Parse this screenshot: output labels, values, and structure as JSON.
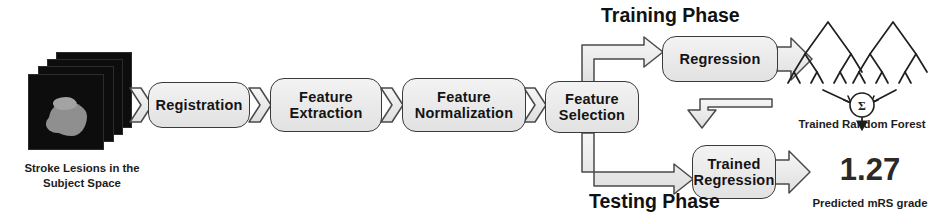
{
  "diagram": {
    "phases": [
      {
        "name": "training-phase",
        "label": "Training Phase"
      },
      {
        "name": "testing-phase",
        "label": "Testing Phase"
      }
    ],
    "input": {
      "caption_line1": "Stroke Lesions in",
      "caption_line2": "the Subject Space",
      "icon": "brain-slice-stack-icon",
      "slice_count": 4
    },
    "pipeline": [
      {
        "name": "registration",
        "line1": "Registration",
        "line2": ""
      },
      {
        "name": "feature-extraction",
        "line1": "Feature",
        "line2": "Extraction"
      },
      {
        "name": "feature-normalization",
        "line1": "Feature",
        "line2": "Normalization"
      },
      {
        "name": "feature-selection",
        "line1": "Feature",
        "line2": "Selection"
      }
    ],
    "branches": [
      {
        "name": "regression",
        "line1": "Regression",
        "line2": ""
      },
      {
        "name": "trained-regression",
        "line1": "Trained",
        "line2": "Regression"
      }
    ],
    "outputs": [
      {
        "name": "trained-random-forest",
        "icon": "random-forest-icon",
        "aggregator_symbol": "Σ",
        "caption": "Trained Random Forest"
      },
      {
        "name": "predicted-mrs-grade",
        "value": "1.27",
        "caption": "Predicted mRS grade"
      }
    ],
    "colors": {
      "box_fill": "#ecECec",
      "box_stroke": "#3a3a3a",
      "arrow_fill": "#efefef",
      "arrow_stroke": "#4a4a4a",
      "text": "#141414",
      "slice_bg": "#0d0d0d",
      "lesion": "#8f8f8f"
    }
  }
}
